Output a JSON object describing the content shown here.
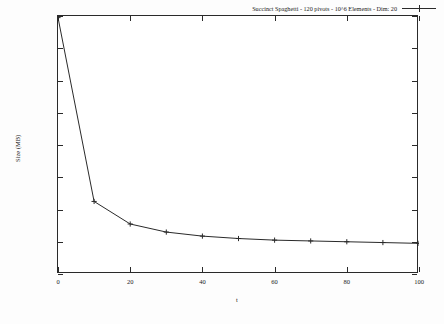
{
  "chart_data": {
    "type": "line",
    "title": "",
    "xlabel": "t",
    "ylabel": "Size (MB)",
    "xlim": [
      0,
      100
    ],
    "ylim": [
      1200,
      1360
    ],
    "xticks": [
      0,
      20,
      40,
      60,
      80,
      100
    ],
    "yticks": [
      1200,
      1220,
      1240,
      1260,
      1280,
      1300,
      1320,
      1340,
      1360
    ],
    "grid": false,
    "legend_position": "top-right",
    "marker": "+",
    "line_color": "#2a2a2a",
    "series": [
      {
        "name": "Succinct Spaghetti - 120 pivots - 10^6 Elements -  Dim: 20",
        "x": [
          0,
          10,
          20,
          30,
          40,
          50,
          60,
          70,
          80,
          90,
          100
        ],
        "values": [
          1359,
          1245,
          1231,
          1226,
          1223.5,
          1222,
          1221,
          1220.5,
          1220,
          1219.5,
          1219
        ]
      }
    ]
  },
  "legend": {
    "entry_label": "Succinct Spaghetti - 120 pivots - 10^6 Elements -  Dim: 20",
    "sample_icon": "line-with-plus-marker"
  },
  "axes": {
    "y_title": "Size (MB)",
    "x_title": "t",
    "y_tick_labels": [
      "1200",
      "1220",
      "1240",
      "1260",
      "1280",
      "1300",
      "1320",
      "1340",
      "1360"
    ],
    "x_tick_labels": [
      "0",
      "20",
      "40",
      "60",
      "80",
      "100"
    ]
  }
}
